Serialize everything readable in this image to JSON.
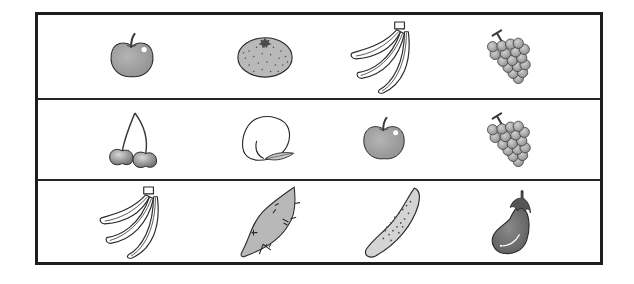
{
  "worksheet": {
    "rows": [
      {
        "items": [
          {
            "label": "apple",
            "icon": "apple-icon"
          },
          {
            "label": "mandarin orange",
            "icon": "orange-icon"
          },
          {
            "label": "banana",
            "icon": "banana-icon"
          },
          {
            "label": "grapes",
            "icon": "grapes-icon"
          }
        ]
      },
      {
        "items": [
          {
            "label": "cherries",
            "icon": "cherries-icon"
          },
          {
            "label": "peach",
            "icon": "peach-icon"
          },
          {
            "label": "apple",
            "icon": "apple-icon"
          },
          {
            "label": "grapes",
            "icon": "grapes-icon"
          }
        ]
      },
      {
        "items": [
          {
            "label": "banana",
            "icon": "banana-icon"
          },
          {
            "label": "sweet potato",
            "icon": "sweet-potato-icon"
          },
          {
            "label": "cucumber",
            "icon": "cucumber-icon"
          },
          {
            "label": "eggplant",
            "icon": "eggplant-icon"
          }
        ]
      }
    ],
    "colors": {
      "frame": "#1e1e1e",
      "fill_gray": "#a8a8a8",
      "fill_light": "#d2d2d2",
      "fill_dark": "#7a7a7a",
      "outline": "#2a2a2a"
    }
  }
}
